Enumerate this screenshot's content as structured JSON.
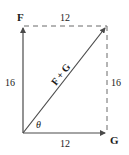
{
  "diagram": {
    "vectors": {
      "F": {
        "label": "F",
        "magnitude_label": "16"
      },
      "G": {
        "label": "G",
        "magnitude_label": "12"
      },
      "resultant": {
        "label": "F + G"
      }
    },
    "sides": {
      "top": "12",
      "bottom": "12",
      "left": "16",
      "right": "16"
    },
    "angle_label": "θ",
    "colors": {
      "vector": "#4a4a4a",
      "dashed": "#6a6a6a",
      "text": "#1a1a1a"
    }
  }
}
